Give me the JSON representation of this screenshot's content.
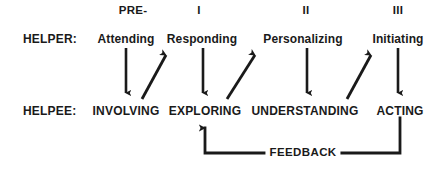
{
  "diagram": {
    "ink_color": "#1a1a1a",
    "background_color": "#ffffff"
  },
  "phases": [
    {
      "label": "PRE-",
      "x": 133
    },
    {
      "label": "I",
      "x": 199
    },
    {
      "label": "II",
      "x": 306
    },
    {
      "label": "III",
      "x": 398
    }
  ],
  "rows": {
    "helper_label": "HELPER:",
    "helpee_label": "HELPEE:"
  },
  "helper_items": [
    {
      "label": "Attending",
      "x": 126
    },
    {
      "label": "Responding",
      "x": 202
    },
    {
      "label": "Personalizing",
      "x": 303
    },
    {
      "label": "Initiating",
      "x": 398
    }
  ],
  "helpee_items": [
    {
      "label": "INVOLVING",
      "x": 126
    },
    {
      "label": "EXPLORING",
      "x": 205
    },
    {
      "label": "UNDERSTANDING",
      "x": 305
    },
    {
      "label": "ACTING",
      "x": 400
    }
  ],
  "down_arrows": [
    {
      "name": "attending-to-involving",
      "x": 126,
      "y1": 48,
      "y2": 99
    },
    {
      "name": "responding-to-exploring",
      "x": 203,
      "y1": 48,
      "y2": 99
    },
    {
      "name": "personalizing-to-understanding",
      "x": 307,
      "y1": 48,
      "y2": 99
    },
    {
      "name": "initiating-to-acting",
      "x": 398,
      "y1": 48,
      "y2": 99
    }
  ],
  "diagonal_arrows": [
    {
      "name": "involving-to-responding",
      "x1": 143,
      "y1": 99,
      "x2": 169,
      "y2": 51
    },
    {
      "name": "exploring-to-personalizing",
      "x1": 228,
      "y1": 99,
      "x2": 258,
      "y2": 51
    },
    {
      "name": "understanding-to-initiating",
      "x1": 348,
      "y1": 99,
      "x2": 374,
      "y2": 51
    }
  ],
  "feedback": {
    "label": "FEEDBACK",
    "label_x": 303,
    "label_y": 150,
    "arrow_tip_x": 205,
    "arrow_tip_y": 121,
    "corner_y": 153,
    "right_x": 400,
    "right_top_y": 118
  }
}
